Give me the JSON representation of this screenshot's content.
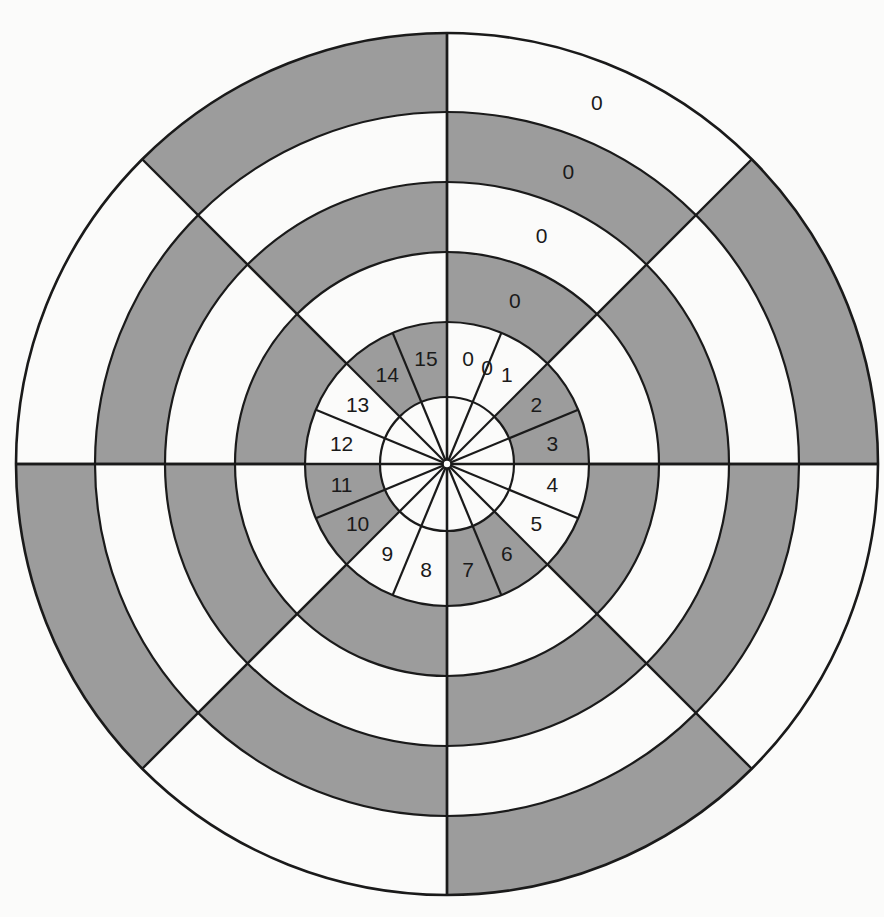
{
  "figure": {
    "kind": "polar-sector-diagram",
    "background_color": "#fbfbfa",
    "line_color": "#1a1a1a",
    "shaded_color": "#9c9c9c",
    "unshaded_color": "#fcfcfb",
    "text_color": "#1a1a1a"
  },
  "chart_data": {
    "type": "pie",
    "subtype": "multi-resolution polar / radar sector map",
    "center": {
      "x": 447,
      "y": 464
    },
    "ring_count": 6,
    "ring_radii": [
      67,
      142,
      212,
      282,
      352,
      431
    ],
    "ring_names": [
      "core",
      "ring-1",
      "ring-2",
      "ring-3",
      "ring-4",
      "ring-5"
    ],
    "inner_sector_count": 16,
    "inner_sector_angle_deg": 22.5,
    "outer_sector_count": 8,
    "outer_sector_angle_deg": 45,
    "angle_origin": "north (12 o'clock)",
    "angle_direction": "clockwise",
    "legend_position": "none",
    "grid": true,
    "inner_sector_labels": [
      "0",
      "1",
      "2",
      "3",
      "4",
      "5",
      "6",
      "7",
      "8",
      "9",
      "10",
      "11",
      "12",
      "13",
      "14",
      "15"
    ],
    "north_column_labels": [
      "0",
      "0",
      "0",
      "0",
      "0"
    ],
    "shading_pattern_note": "checkerboard: a cell is shaded when (ring_index + sector_index) is odd",
    "shaded_cells": [
      {
        "ring": 1,
        "sectors": [
          1,
          3,
          5,
          7
        ]
      },
      {
        "ring": 2,
        "sectors": [
          0,
          2,
          4,
          6
        ]
      },
      {
        "ring": 3,
        "sectors": [
          1,
          3,
          5,
          7
        ]
      },
      {
        "ring": 4,
        "sectors": [
          0,
          2,
          4,
          6
        ]
      },
      {
        "ring": 5,
        "sectors": [
          1,
          3,
          5,
          7
        ]
      }
    ]
  }
}
